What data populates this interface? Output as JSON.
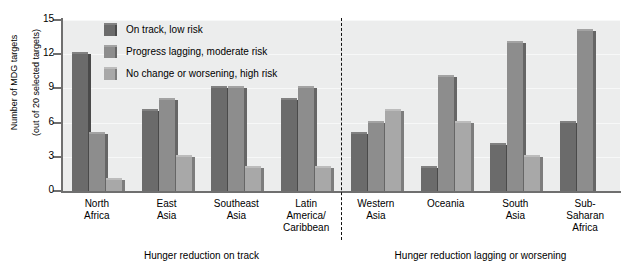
{
  "chart_data": {
    "type": "bar",
    "title": "",
    "subtitle": "",
    "xlabel": "",
    "ylabel": "Number of MDG targets (out of 20 selected targets)",
    "ylabel_lines": [
      "Number of MDG targets",
      "(out of 20 selected targets)"
    ],
    "ylim": [
      0,
      15
    ],
    "yticks": [
      0,
      3,
      6,
      9,
      12,
      15
    ],
    "grid": true,
    "legend_position": "top-left-inside",
    "categories": [
      "North Africa",
      "East Asia",
      "Southeast Asia",
      "Latin America/Caribbean",
      "Western Asia",
      "Oceania",
      "South Asia",
      "Sub-Saharan Africa"
    ],
    "category_label_lines": [
      [
        "North",
        "Africa"
      ],
      [
        "East",
        "Asia"
      ],
      [
        "Southeast",
        "Asia"
      ],
      [
        "Latin",
        "America/",
        "Caribbean"
      ],
      [
        "Western",
        "Asia"
      ],
      [
        "Oceania"
      ],
      [
        "South",
        "Asia"
      ],
      [
        "Sub-",
        "Saharan",
        "Africa"
      ]
    ],
    "series": [
      {
        "name": "On track, low risk",
        "color": "#6b6b6b",
        "values": [
          12,
          7,
          9,
          8,
          5,
          2,
          4,
          6
        ]
      },
      {
        "name": "Progress lagging, moderate risk",
        "color": "#8d8d8d",
        "values": [
          5,
          8,
          9,
          9,
          6,
          10,
          13,
          14
        ]
      },
      {
        "name": "No change or worsening, high risk",
        "color": "#a8a8a8",
        "values": [
          1,
          3,
          2,
          2,
          7,
          6,
          3,
          0
        ]
      }
    ],
    "group_captions": [
      {
        "text": "Hunger reduction on track",
        "categories": [
          0,
          1,
          2,
          3
        ]
      },
      {
        "text": "Hunger reduction lagging or worsening",
        "categories": [
          4,
          5,
          6,
          7
        ]
      }
    ],
    "divider": {
      "after_category_index": 3,
      "style": "dashed"
    },
    "plot_background": "#eceded",
    "axis_color": "#6f6f6f",
    "gridline_color": "#f7f8f8"
  }
}
